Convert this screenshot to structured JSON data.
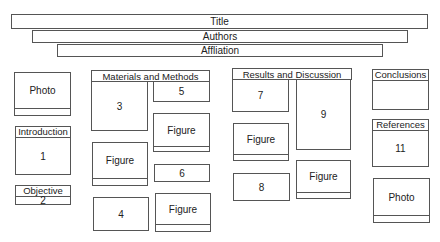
{
  "header": {
    "title": "Title",
    "authors": "Authors",
    "affiliation": "Affliation"
  },
  "left_column": {
    "photo": "Photo",
    "introduction": {
      "heading": "Introduction",
      "number": "1"
    },
    "objective": {
      "heading": "Objective",
      "number": "2"
    }
  },
  "materials_methods": {
    "heading": "Materials and Methods",
    "block_3": "3",
    "block_5": "5",
    "figure_a": "Figure",
    "figure_b": "Figure",
    "block_6": "6",
    "block_4": "4",
    "figure_c": "Figure"
  },
  "results_discussion": {
    "heading": "Results and Discussion",
    "block_7": "7",
    "block_9": "9",
    "figure_a": "Figure",
    "block_8": "8",
    "figure_b": "Figure"
  },
  "right_column": {
    "conclusions": {
      "heading": "Conclusions"
    },
    "references": {
      "heading": "References",
      "number": "11"
    },
    "photo": "Photo"
  }
}
